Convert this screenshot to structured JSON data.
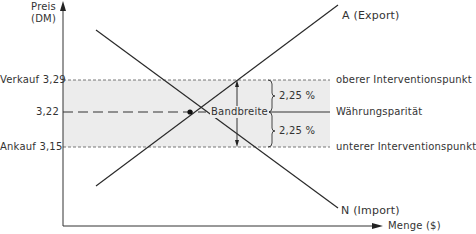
{
  "axes": {
    "y_label_line1": "Preis",
    "y_label_line2": "(DM)",
    "x_label": "Menge ($)"
  },
  "price_levels": {
    "upper": {
      "name": "Verkauf",
      "value": "3,29",
      "right_label": "oberer Interventionspunkt"
    },
    "parity": {
      "value": "3,22",
      "right_label": "Währungsparität"
    },
    "lower": {
      "name": "Ankauf",
      "value": "3,15",
      "right_label": "unterer Interventionspunkt"
    }
  },
  "curves": {
    "supply": "A (Export)",
    "demand": "N (Import)"
  },
  "band": {
    "label": "Bandbreite",
    "upper_pct": "2,25 %",
    "lower_pct": "2,25 %"
  },
  "colors": {
    "band_fill": "#ececec",
    "line": "#2a2a2a"
  }
}
